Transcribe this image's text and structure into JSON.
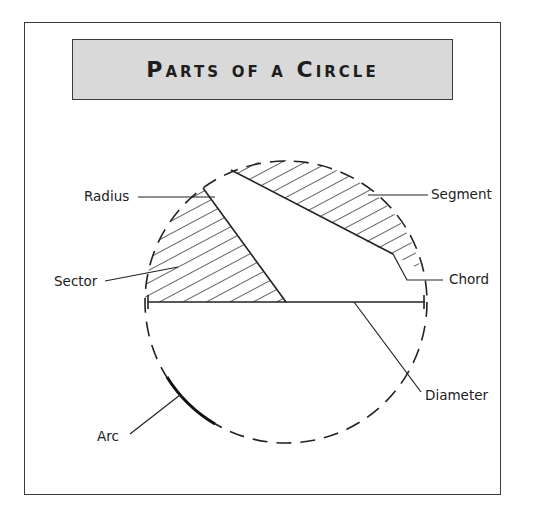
{
  "title": "Parts of a Circle",
  "labels": {
    "radius": "Radius",
    "segment": "Segment",
    "sector": "Sector",
    "chord": "Chord",
    "diameter": "Diameter",
    "arc": "Arc"
  },
  "colors": {
    "title_background": "#d9d9d9",
    "stroke": "#222222",
    "background": "#ffffff"
  }
}
